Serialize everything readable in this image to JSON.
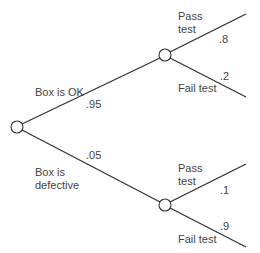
{
  "diagram": {
    "type": "probability-tree",
    "colors": {
      "line": "#333333",
      "text": "#444444",
      "background": "#ffffff"
    },
    "root": {
      "branches": [
        {
          "label_line1": "Box is OK",
          "label_line2": "",
          "probability": ".95",
          "child": {
            "branches": [
              {
                "label_line1": "Pass",
                "label_line2": "test",
                "probability": ".8"
              },
              {
                "label_line1": "Fail test",
                "label_line2": "",
                "probability": ".2"
              }
            ]
          }
        },
        {
          "label_line1": "Box is",
          "label_line2": "defective",
          "probability": ".05",
          "child": {
            "branches": [
              {
                "label_line1": "Pass",
                "label_line2": "test",
                "probability": ".1"
              },
              {
                "label_line1": "Fail test",
                "label_line2": "",
                "probability": ".9"
              }
            ]
          }
        }
      ]
    }
  }
}
